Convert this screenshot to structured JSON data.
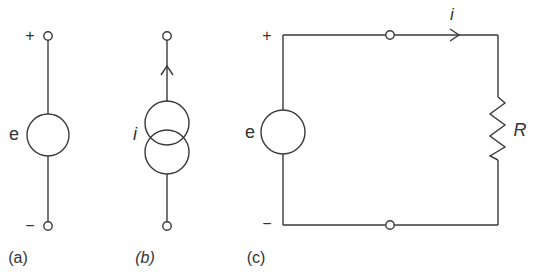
{
  "diagram": {
    "type": "circuit-schematic",
    "colors": {
      "line": "#3a3a3a",
      "text": "#333333",
      "background": "#ffffff"
    },
    "panels": [
      {
        "id": "a",
        "caption": "(a)",
        "element": "voltage-source",
        "source_label": "e",
        "plus_label": "+",
        "minus_label": "−"
      },
      {
        "id": "b",
        "caption": "(b)",
        "element": "current-source",
        "source_label": "i"
      },
      {
        "id": "c",
        "caption": "(c)",
        "element": "voltage-source-with-resistor-loop",
        "source_label": "e",
        "plus_label": "+",
        "minus_label": "−",
        "current_label": "i",
        "resistor_label": "R"
      }
    ]
  }
}
